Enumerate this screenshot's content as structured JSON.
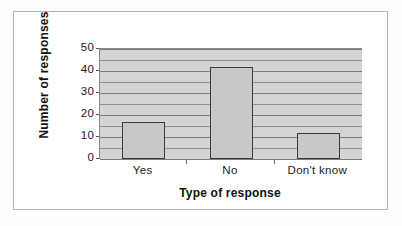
{
  "chart_data": {
    "type": "bar",
    "title": "",
    "categories": [
      "Yes",
      "No",
      "Don't know"
    ],
    "values": [
      17,
      42,
      12
    ],
    "series": [
      {
        "name": "Number of responses",
        "values": [
          17,
          42,
          12
        ]
      }
    ],
    "xlabel": "Type of response",
    "ylabel": "Number of responses",
    "ylim": [
      0,
      50
    ],
    "yticks": [
      0,
      10,
      20,
      30,
      40,
      50
    ],
    "ytick_labels": [
      "0",
      "10",
      "20",
      "30",
      "40",
      "50"
    ],
    "minor_tick_step": 5,
    "grid": true,
    "grid_orientation": "horizontal",
    "legend": false,
    "colors": {
      "bar_fill": "#c8c8c8",
      "bar_border": "#3a3a3a",
      "plot_background": "#d4d4d4",
      "gridline": "#8e8e8e",
      "axis_line": "#555555",
      "text": "#1a1a1a",
      "frame_border": "#b4b4b4",
      "figure_background": "#ffffff"
    }
  }
}
